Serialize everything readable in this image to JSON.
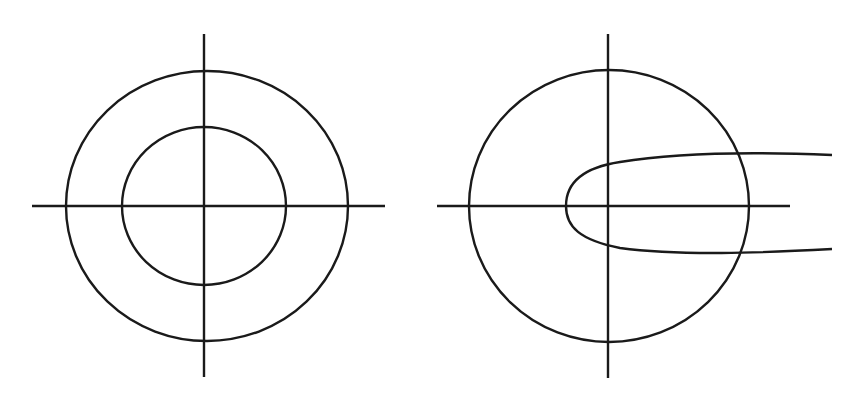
{
  "figure": {
    "background": "#ffffff",
    "stroke_color": "#1a1a1a",
    "panels": [
      {
        "id": "left",
        "description": "Two concentric circles centered at the origin of crossed axes",
        "axes": {
          "h": [
            32,
            206,
            385,
            206
          ],
          "v": [
            204,
            34,
            204,
            377
          ]
        },
        "shapes": [
          {
            "type": "ellipse",
            "name": "outer-circle",
            "cx": 207,
            "cy": 206,
            "rx": 141,
            "ry": 135
          },
          {
            "type": "ellipse",
            "name": "inner-circle",
            "cx": 204,
            "cy": 206,
            "rx": 82,
            "ry": 79
          }
        ]
      },
      {
        "id": "right",
        "description": "A circle centered at the origin with a rightward-opening parabolic curve crossing it",
        "axes": {
          "h": [
            437,
            206,
            790,
            206
          ],
          "v": [
            608,
            34,
            608,
            378
          ]
        },
        "shapes": [
          {
            "type": "ellipse",
            "name": "circle",
            "cx": 609,
            "cy": 206,
            "rx": 140,
            "ry": 136
          },
          {
            "type": "path",
            "name": "parabola-curve",
            "d": "M 832 155 C 760 152, 680 152, 620 162 C 580 168, 566 185, 566 206 C 566 227, 580 240, 620 248 C 680 256, 760 253, 832 249"
          }
        ]
      }
    ]
  }
}
